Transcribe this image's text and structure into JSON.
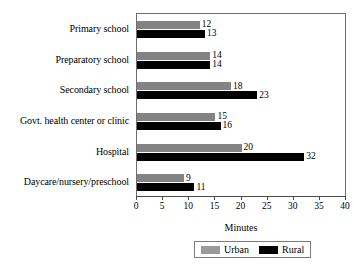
{
  "chart_data": {
    "type": "bar",
    "orientation": "horizontal",
    "title": "",
    "xlabel": "Minutes",
    "ylabel": "",
    "xlim": [
      0,
      40
    ],
    "xticks": [
      0,
      5,
      10,
      15,
      20,
      25,
      30,
      35,
      40
    ],
    "grid": false,
    "legend_position": "bottom",
    "categories": [
      "Primary school",
      "Preparatory school",
      "Secondary school",
      "Govt. health center or clinic",
      "Hospital",
      "Daycare/nursery/preschool"
    ],
    "series": [
      {
        "name": "Urban",
        "color": "#838383",
        "values": [
          12,
          14,
          18,
          15,
          20,
          9
        ]
      },
      {
        "name": "Rural",
        "color": "#000000",
        "values": [
          13,
          14,
          23,
          16,
          32,
          11
        ]
      }
    ]
  },
  "legend": {
    "entries": [
      {
        "label": "Urban",
        "swatch": "urban-swatch"
      },
      {
        "label": "Rural",
        "swatch": "rural-swatch"
      }
    ]
  }
}
